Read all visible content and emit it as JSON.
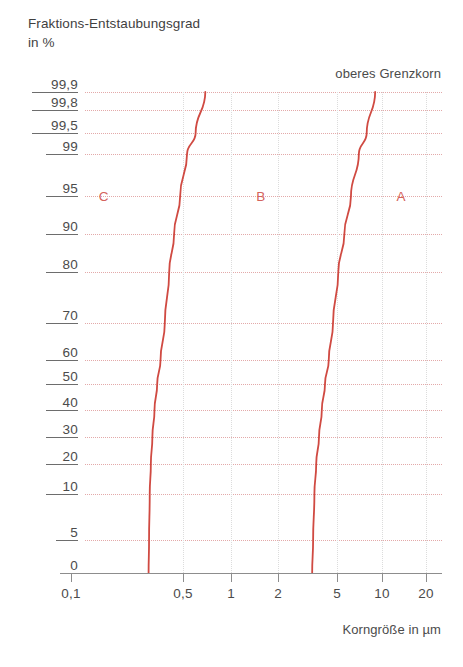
{
  "axis_title_y": "Fraktions-Entstaubungsgrad\nin %",
  "axis_title_x": "Korngröße in µm",
  "note": "oberes Grenzkorn",
  "colors": {
    "curve": "#d04a42",
    "grid": "#e3a9a9",
    "grid_vertical": "#dcdcdc",
    "text": "#4b4b4b",
    "axis": "#8d8d8d"
  },
  "chart_data": {
    "type": "line",
    "title": "Fraktions-Entstaubungsgrad in %",
    "xlabel": "Korngröße in µm",
    "ylabel": "Fraktions-Entstaubungsgrad in %",
    "xscale": "log",
    "yscale": "probability",
    "grid": true,
    "legend": "inline-labels",
    "xlim": [
      0.08,
      24
    ],
    "ylim": [
      0,
      99.9
    ],
    "xticks": [
      0.1,
      0.5,
      1,
      2,
      5,
      10,
      20
    ],
    "xticklabels": [
      "0,1",
      "0,5",
      "1",
      "2",
      "5",
      "10",
      "20"
    ],
    "yticks": [
      0,
      5,
      10,
      20,
      30,
      40,
      50,
      60,
      70,
      80,
      90,
      95,
      99,
      99.5,
      99.8,
      99.9
    ],
    "yticklabels": [
      "0",
      "5",
      "10",
      "20",
      "30",
      "40",
      "50",
      "60",
      "70",
      "80",
      "90",
      "95",
      "99",
      "99,5",
      "99,8",
      "99,9"
    ],
    "annotations": [
      {
        "text": "oberes Grenzkorn",
        "x": 12,
        "y": 99.95
      },
      {
        "text": "C",
        "x": 0.16,
        "y": 95
      },
      {
        "text": "B",
        "x": 1.55,
        "y": 95
      },
      {
        "text": "A",
        "x": 13.5,
        "y": 95
      }
    ],
    "series": [
      {
        "name": "C",
        "label": "C",
        "color": "#d04a42",
        "x": [
          0.305,
          0.307,
          0.31,
          0.315,
          0.322,
          0.332,
          0.345,
          0.362,
          0.385,
          0.41,
          0.44,
          0.48,
          0.53,
          0.6,
          0.69
        ],
        "y": [
          0,
          5,
          10,
          20,
          30,
          40,
          50,
          60,
          70,
          80,
          90,
          95,
          99,
          99.5,
          99.9
        ]
      },
      {
        "name": "A",
        "label": "A",
        "color": "#d04a42",
        "x": [
          3.4,
          3.45,
          3.52,
          3.62,
          3.78,
          3.95,
          4.15,
          4.4,
          4.7,
          5.1,
          5.6,
          6.2,
          7.0,
          7.9,
          9.0
        ],
        "y": [
          0,
          5,
          10,
          20,
          30,
          40,
          50,
          60,
          70,
          80,
          90,
          95,
          99,
          99.5,
          99.9
        ]
      }
    ]
  },
  "y_axis": {
    "ticks": [
      {
        "label": "99,9",
        "py": 92
      },
      {
        "label": "99,8",
        "py": 110
      },
      {
        "label": "99,5",
        "py": 133
      },
      {
        "label": "99",
        "py": 154
      },
      {
        "label": "95",
        "py": 196
      },
      {
        "label": "90",
        "py": 234
      },
      {
        "label": "80",
        "py": 272
      },
      {
        "label": "70",
        "py": 323
      },
      {
        "label": "60",
        "py": 360
      },
      {
        "label": "50",
        "py": 384
      },
      {
        "label": "40",
        "py": 410
      },
      {
        "label": "30",
        "py": 437
      },
      {
        "label": "20",
        "py": 464
      },
      {
        "label": "10",
        "py": 494
      },
      {
        "label": "5",
        "py": 540
      },
      {
        "label": "0",
        "py": 573
      }
    ]
  },
  "x_axis": {
    "ticks": [
      {
        "label": "0,1",
        "px": 71
      },
      {
        "label": "0,5",
        "px": 183
      },
      {
        "label": "1",
        "px": 231
      },
      {
        "label": "2",
        "px": 278
      },
      {
        "label": "5",
        "px": 337
      },
      {
        "label": "10",
        "px": 382
      },
      {
        "label": "20",
        "px": 426
      }
    ]
  }
}
